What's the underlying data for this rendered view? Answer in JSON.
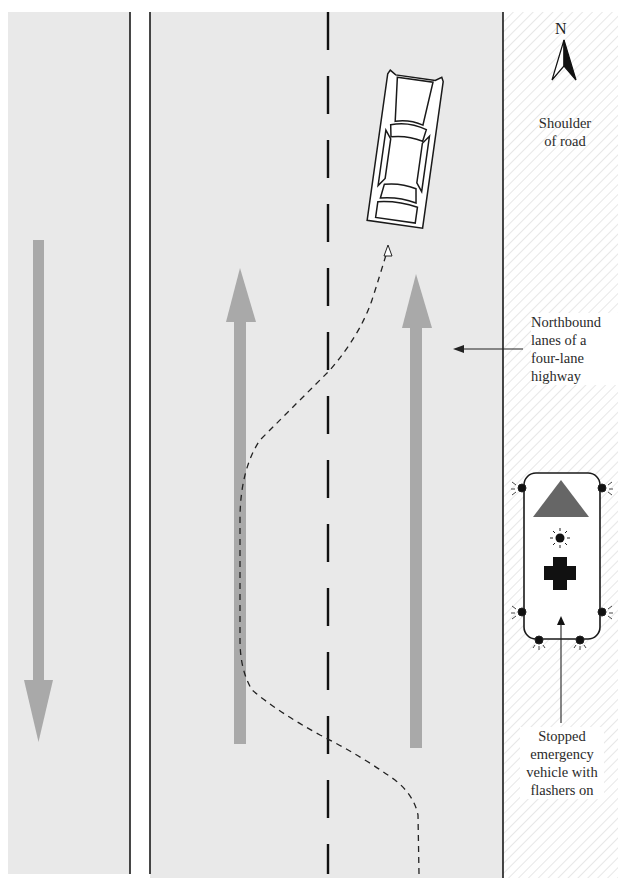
{
  "diagram": {
    "colors": {
      "road": "#e9e9e9",
      "shoulder": "#ffffff",
      "hatch": "#d4d4d4",
      "lane_arrow": "#a9a9a9",
      "line": "#1a1a1a",
      "triangle": "#666666",
      "cross": "#111111"
    },
    "compass": {
      "label": "N"
    },
    "labels": {
      "shoulder": [
        "Shoulder",
        "of road"
      ],
      "northbound": [
        "Northbound",
        "lanes of a",
        "four-lane",
        "highway"
      ],
      "emergency": [
        "Stopped",
        "emergency",
        "vehicle with",
        "flashers on"
      ]
    },
    "lanes": [
      {
        "name": "southbound-lanes",
        "direction": "south"
      },
      {
        "name": "northbound-left-lane",
        "direction": "north"
      },
      {
        "name": "northbound-right-lane",
        "direction": "north"
      }
    ],
    "elements": {
      "car": "passenger car changing lanes",
      "path": "dashed vehicle path from right lane to left lane",
      "emergency_vehicle": "stopped emergency vehicle on shoulder"
    }
  }
}
